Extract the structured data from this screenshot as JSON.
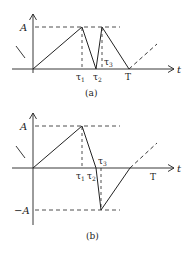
{
  "diagrams": [
    {
      "id": "a",
      "caption": "(a)",
      "y_label_pos": "A",
      "x_label": "t",
      "tick_labels": [
        "τ1",
        "τ2",
        "τ3",
        "T"
      ],
      "tau1": "τ",
      "tau1_sub": "1",
      "tau2": "τ",
      "tau2_sub": "2",
      "tau3": "τ",
      "tau3_sub": "3",
      "period": "T"
    },
    {
      "id": "b",
      "caption": "(b)",
      "y_label_pos": "A",
      "y_label_neg": "−A",
      "x_label": "t",
      "tick_labels": [
        "τ1",
        "τ2",
        "τ3",
        "T"
      ],
      "tau1": "τ",
      "tau1_sub": "1",
      "tau2": "τ",
      "tau2_sub": "2",
      "tau3": "τ",
      "tau3_sub": "3",
      "period": "T"
    }
  ],
  "colors": {
    "line": "#222222",
    "background": "#ffffff"
  }
}
